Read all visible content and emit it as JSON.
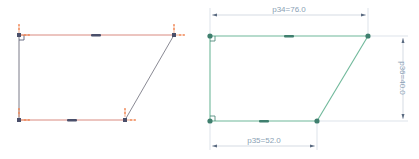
{
  "left_sketch": {
    "state": "unconstrained",
    "line_color": "#d98a80",
    "left_edge_color": "#7a7a88",
    "diagonal_color": "#8a8a94",
    "point_color": "#4a4f6a",
    "handle_color": "#f08a5a"
  },
  "right_sketch": {
    "state": "fully-constrained",
    "line_color": "#6fb89a",
    "point_color": "#3f7f6e",
    "dimension_color": "#8a9fb5",
    "dimensions": [
      {
        "name": "p34",
        "value": "76.0",
        "label": "p34=76.0",
        "orientation": "horizontal",
        "edge": "top"
      },
      {
        "name": "p35",
        "value": "52.0",
        "label": "p35=52.0",
        "orientation": "horizontal",
        "edge": "bottom"
      },
      {
        "name": "p36",
        "value": "40.0",
        "label": "p36=40.0",
        "orientation": "vertical",
        "edge": "right"
      }
    ]
  }
}
